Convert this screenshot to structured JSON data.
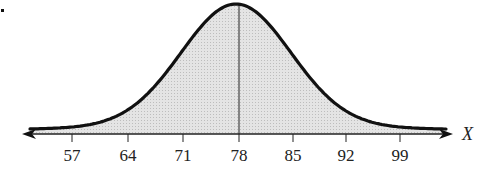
{
  "chart_data": {
    "type": "area",
    "title": "",
    "mean": 78,
    "std_dev": 7,
    "xlabel": "X",
    "ylabel": "",
    "x_ticks": [
      57,
      64,
      71,
      78,
      85,
      92,
      99
    ],
    "tick_labels": [
      "57",
      "64",
      "71",
      "78",
      "85",
      "92",
      "99"
    ],
    "xlim": [
      50,
      106
    ],
    "grid": false,
    "legend": null,
    "fill_color": "#d9d9d9",
    "curve_color": "#111111"
  },
  "axis": {
    "x_label": "X",
    "ticks": [
      {
        "label": "57",
        "x": 72
      },
      {
        "label": "64",
        "x": 128
      },
      {
        "label": "71",
        "x": 183
      },
      {
        "label": "78",
        "x": 239
      },
      {
        "label": "85",
        "x": 293
      },
      {
        "label": "92",
        "x": 346
      },
      {
        "label": "99",
        "x": 400
      }
    ]
  }
}
